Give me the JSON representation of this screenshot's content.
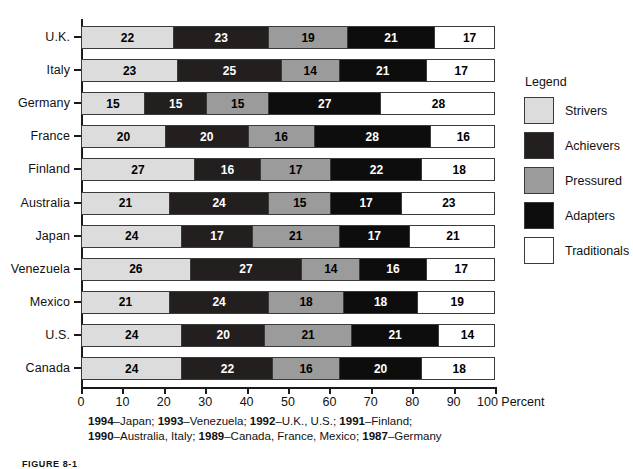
{
  "chart_data": {
    "type": "bar",
    "subtype": "horizontal-stacked-100",
    "title": "",
    "xlabel": "Percent",
    "ylabel": "",
    "xlim": [
      0,
      100
    ],
    "xticks": [
      0,
      10,
      20,
      30,
      40,
      50,
      60,
      70,
      80,
      90,
      100
    ],
    "xtick_labels": [
      "0",
      "10",
      "20",
      "30",
      "40",
      "50",
      "60",
      "70",
      "80",
      "90",
      "100 Percent"
    ],
    "grid": false,
    "legend_position": "right",
    "legend_title": "Legend",
    "categories": [
      "U.K.",
      "Italy",
      "Germany",
      "France",
      "Finland",
      "Australia",
      "Japan",
      "Venezuela",
      "Mexico",
      "U.S.",
      "Canada"
    ],
    "series": [
      {
        "name": "Strivers",
        "color": "#dcdcdc",
        "values": [
          22,
          23,
          15,
          20,
          27,
          21,
          24,
          26,
          21,
          24,
          24
        ]
      },
      {
        "name": "Achievers",
        "color": "#231f1f",
        "values": [
          23,
          25,
          15,
          20,
          16,
          24,
          17,
          27,
          24,
          20,
          22
        ]
      },
      {
        "name": "Pressured",
        "color": "#9b9b9b",
        "values": [
          19,
          14,
          15,
          16,
          17,
          15,
          21,
          14,
          18,
          21,
          16
        ]
      },
      {
        "name": "Adapters",
        "color": "#0d0d0d",
        "values": [
          21,
          21,
          27,
          28,
          22,
          17,
          17,
          16,
          18,
          21,
          20
        ]
      },
      {
        "name": "Traditionals",
        "color": "#ffffff",
        "values": [
          17,
          17,
          28,
          16,
          18,
          23,
          21,
          17,
          19,
          14,
          18
        ]
      }
    ],
    "annotations": [
      "1994–Japan; 1993–Venezuela; 1992–U.K., U.S.; 1991–Finland;",
      "1990–Australia, Italy; 1989–Canada, France, Mexico; 1987–Germany"
    ]
  },
  "legend": {
    "title": "Legend",
    "items": [
      {
        "label": "Strivers",
        "swatch": "light-gray"
      },
      {
        "label": "Achievers",
        "swatch": "dark-gray"
      },
      {
        "label": "Pressured",
        "swatch": "medium-gray"
      },
      {
        "label": "Adapters",
        "swatch": "black"
      },
      {
        "label": "Traditionals",
        "swatch": "white"
      }
    ]
  },
  "footnote": {
    "line1_parts": [
      {
        "text": "1994",
        "bold": true
      },
      {
        "text": "–Japan; ",
        "bold": false
      },
      {
        "text": "1993",
        "bold": true
      },
      {
        "text": "–Venezuela; ",
        "bold": false
      },
      {
        "text": "1992",
        "bold": true
      },
      {
        "text": "–U.K., U.S.; ",
        "bold": false
      },
      {
        "text": "1991",
        "bold": true
      },
      {
        "text": "–Finland;",
        "bold": false
      }
    ],
    "line2_parts": [
      {
        "text": "1990",
        "bold": true
      },
      {
        "text": "–Australia, Italy; ",
        "bold": false
      },
      {
        "text": "1989",
        "bold": true
      },
      {
        "text": "–Canada, France, Mexico; ",
        "bold": false
      },
      {
        "text": "1987",
        "bold": true
      },
      {
        "text": "–Germany",
        "bold": false
      }
    ]
  },
  "figure_caption": "FIGURE 8-1"
}
